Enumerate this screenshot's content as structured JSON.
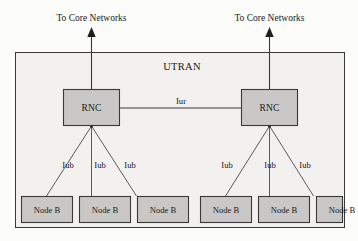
{
  "diagram": {
    "title_label": "UTRAN",
    "core_network_labels": [
      "To Core Networks",
      "To Core Networks"
    ],
    "colors": {
      "page_background": "#fcfcfb",
      "utran_fill": "#f2f1ef",
      "node_fill": "#c9c8c6",
      "stroke": "#3a3a3a",
      "text": "#1a1a1a"
    },
    "rnc_nodes": [
      {
        "id": "rnc-left",
        "label": "RNC"
      },
      {
        "id": "rnc-right",
        "label": "RNC"
      }
    ],
    "interface_labels": {
      "iur": "Iur",
      "iub": "Iub"
    },
    "iur_links": [
      {
        "label": "Iur",
        "from": "rnc-left",
        "to": "rnc-right"
      }
    ],
    "left_group": {
      "rnc_label": "RNC",
      "core_label": "To Core Networks",
      "node_bs": [
        {
          "label": "Node B",
          "interface": "Iub"
        },
        {
          "label": "Node B",
          "interface": "Iub"
        },
        {
          "label": "Node B",
          "interface": "Iub"
        }
      ]
    },
    "right_group": {
      "rnc_label": "RNC",
      "core_label": "To Core Networks",
      "node_bs": [
        {
          "label": "Node B",
          "interface": "Iub"
        },
        {
          "label": "Node B",
          "interface": "Iub"
        },
        {
          "label": "Node B",
          "interface": "Iub"
        }
      ]
    }
  }
}
